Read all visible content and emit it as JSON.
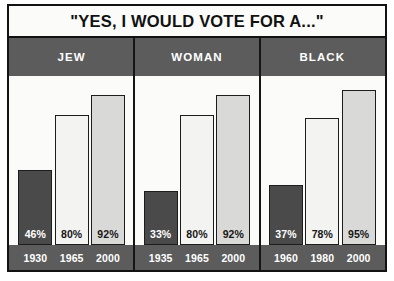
{
  "chart_data": {
    "type": "bar",
    "title": "\"YES, I WOULD VOTE FOR A...\"",
    "subtitle": "",
    "xlabel": "",
    "ylabel": "",
    "ylim": [
      0,
      100
    ],
    "grid": false,
    "legend_position": "none",
    "value_suffix": "%",
    "groups": [
      {
        "name": "JEW",
        "categories": [
          "1930",
          "1965",
          "2000"
        ],
        "values": [
          46,
          80,
          92
        ],
        "value_labels": [
          "46%",
          "80%",
          "92%"
        ],
        "tones": [
          "dark",
          "light",
          "mid"
        ]
      },
      {
        "name": "WOMAN",
        "categories": [
          "1935",
          "1965",
          "2000"
        ],
        "values": [
          33,
          80,
          92
        ],
        "value_labels": [
          "33%",
          "80%",
          "92%"
        ],
        "tones": [
          "dark",
          "light",
          "mid"
        ]
      },
      {
        "name": "BLACK",
        "categories": [
          "1960",
          "1980",
          "2000"
        ],
        "values": [
          37,
          78,
          95
        ],
        "value_labels": [
          "37%",
          "78%",
          "95%"
        ],
        "tones": [
          "dark",
          "light",
          "mid"
        ]
      }
    ],
    "colors": {
      "bar_dark": "#4a4a4a",
      "bar_light": "#f3f3f1",
      "bar_mid": "#d9d9d7",
      "band": "#5c5c5c",
      "outline": "#121212",
      "plot_background": "#fbfbf9"
    }
  }
}
